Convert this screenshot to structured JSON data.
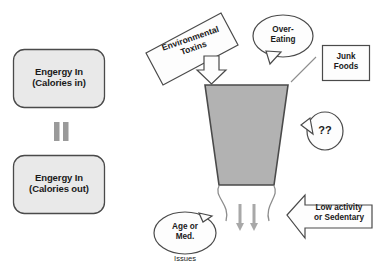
{
  "diagram": {
    "colors": {
      "box_fill": "#e9e9e9",
      "funnel_fill": "#b2b2b2",
      "outline": "#4a4a4a",
      "soft_outline": "#8d8d8d",
      "text": "#1a1a1a"
    },
    "left_column": {
      "box_in": {
        "line1": "Engergy In",
        "line2": "(Calories in)"
      },
      "equals_symbol": "=",
      "box_out": {
        "line1": "Engergy In",
        "line2": "(Calories out)"
      }
    },
    "funnel": {
      "name": "funnel-body",
      "outflow_arrows": 2
    },
    "callouts": {
      "toxins": {
        "line1": "Environmental",
        "line2": "Toxins",
        "shape": "rotated-rectangle-with-down-arrow"
      },
      "over_eating": {
        "line1": "Over-",
        "line2": "Eating",
        "shape": "speech-bubble"
      },
      "junk_foods": {
        "line1": "Junk",
        "line2": "Foods",
        "shape": "rectangle"
      },
      "question": {
        "text": "??",
        "shape": "speech-bubble"
      },
      "low_activity": {
        "line1": "Low activity",
        "line2": "or Sedentary",
        "shape": "left-arrow"
      },
      "age_med": {
        "line1": "Age or",
        "line2": "Med.",
        "caption": "Issues",
        "shape": "speech-bubble"
      }
    }
  }
}
